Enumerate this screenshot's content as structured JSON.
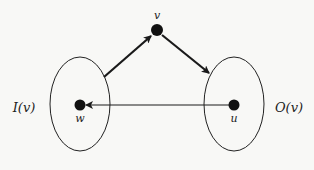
{
  "diagram": {
    "nodes": [
      {
        "id": "v",
        "label": "v",
        "x": 157,
        "y": 30
      },
      {
        "id": "w",
        "label": "w",
        "x": 80,
        "y": 105
      },
      {
        "id": "u",
        "label": "u",
        "x": 234,
        "y": 105
      }
    ],
    "sets": [
      {
        "id": "in",
        "label": "I(v)",
        "cx": 80,
        "cy": 104,
        "rx": 30,
        "ry": 47
      },
      {
        "id": "out",
        "label": "O(v)",
        "cx": 234,
        "cy": 104,
        "rx": 30,
        "ry": 47
      }
    ],
    "edges": [
      {
        "from": "I(v)",
        "to": "v",
        "style": "thick"
      },
      {
        "from": "v",
        "to": "O(v)",
        "style": "thick"
      },
      {
        "from": "u",
        "to": "w",
        "style": "thin"
      }
    ],
    "colors": {
      "stroke": "#1a1a1a",
      "background": "#f8f8f6"
    }
  }
}
